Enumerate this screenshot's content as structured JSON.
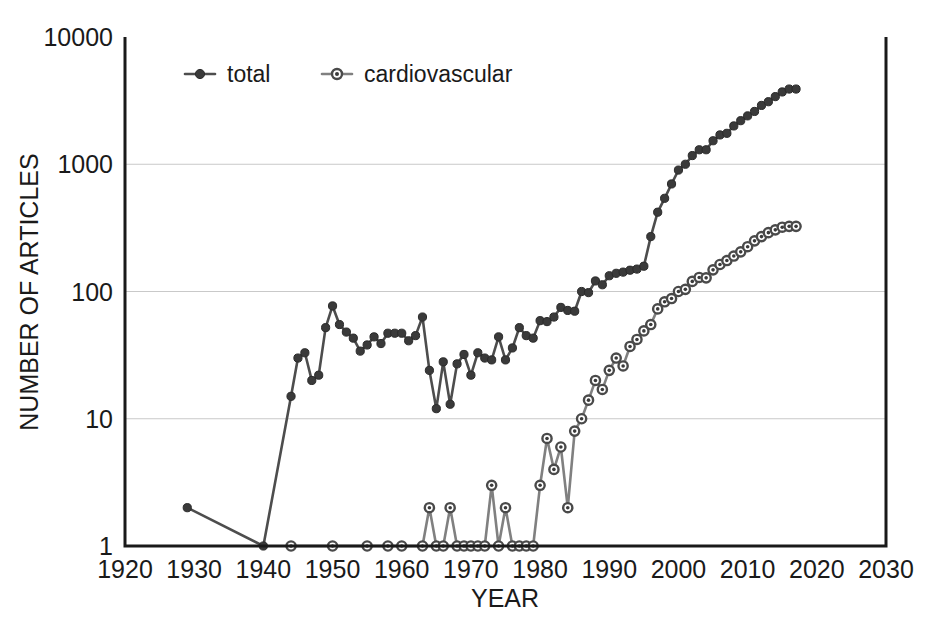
{
  "chart_data": {
    "type": "line",
    "title": "",
    "xlabel": "YEAR",
    "ylabel": "NUMBER OF ARTICLES",
    "xlim": [
      1920,
      2030
    ],
    "ylim": [
      1,
      10000
    ],
    "yscale": "log",
    "grid": "horizontal",
    "legend_position": "top-left-inside",
    "xticks": [
      1920,
      1930,
      1940,
      1950,
      1960,
      1970,
      1980,
      1990,
      2000,
      2010,
      2020,
      2030
    ],
    "xtick_labels": [
      "1920",
      "1930",
      "1940",
      "1950",
      "1960",
      "1970",
      "1980",
      "1990",
      "2000",
      "2010",
      "2020",
      "2030"
    ],
    "yticks": [
      1,
      10,
      100,
      1000,
      10000
    ],
    "ytick_labels": [
      "1",
      "10",
      "100",
      "1000",
      "10000"
    ],
    "series": [
      {
        "name": "total",
        "marker": "filled-circle",
        "color": "#3a3a3a",
        "x": [
          1929,
          1940,
          1944,
          1945,
          1946,
          1947,
          1948,
          1949,
          1950,
          1951,
          1952,
          1953,
          1954,
          1955,
          1956,
          1957,
          1958,
          1959,
          1960,
          1961,
          1962,
          1963,
          1964,
          1965,
          1966,
          1967,
          1968,
          1969,
          1970,
          1971,
          1972,
          1973,
          1974,
          1975,
          1976,
          1977,
          1978,
          1979,
          1980,
          1981,
          1982,
          1983,
          1984,
          1985,
          1986,
          1987,
          1988,
          1989,
          1990,
          1991,
          1992,
          1993,
          1994,
          1995,
          1996,
          1997,
          1998,
          1999,
          2000,
          2001,
          2002,
          2003,
          2004,
          2005,
          2006,
          2007,
          2008,
          2009,
          2010,
          2011,
          2012,
          2013,
          2014,
          2015,
          2016,
          2017
        ],
        "y": [
          2,
          1,
          15,
          30,
          33,
          20,
          22,
          52,
          77,
          55,
          48,
          43,
          34,
          38,
          44,
          39,
          47,
          47,
          47,
          41,
          45,
          63,
          24,
          12,
          28,
          13,
          27,
          32,
          22,
          33,
          30,
          29,
          44,
          29,
          36,
          52,
          45,
          43,
          59,
          58,
          63,
          75,
          71,
          70,
          100,
          98,
          121,
          113,
          133,
          139,
          142,
          147,
          150,
          158,
          270,
          420,
          540,
          700,
          900,
          1000,
          1170,
          1300,
          1300,
          1530,
          1700,
          1750,
          2000,
          2200,
          2400,
          2600,
          2900,
          3100,
          3400,
          3700,
          3900,
          3900
        ]
      },
      {
        "name": "cardiovascular",
        "marker": "bullseye-circle",
        "color": "#4a4a4a",
        "x": [
          1944,
          1950,
          1955,
          1958,
          1960,
          1963,
          1964,
          1965,
          1966,
          1967,
          1968,
          1969,
          1970,
          1971,
          1972,
          1973,
          1974,
          1975,
          1976,
          1977,
          1978,
          1979,
          1980,
          1981,
          1982,
          1983,
          1984,
          1985,
          1986,
          1987,
          1988,
          1989,
          1990,
          1991,
          1992,
          1993,
          1994,
          1995,
          1996,
          1997,
          1998,
          1999,
          2000,
          2001,
          2002,
          2003,
          2004,
          2005,
          2006,
          2007,
          2008,
          2009,
          2010,
          2011,
          2012,
          2013,
          2014,
          2015,
          2016,
          2017
        ],
        "y": [
          1,
          1,
          1,
          1,
          1,
          1,
          2,
          1,
          1,
          2,
          1,
          1,
          1,
          1,
          1,
          3,
          1,
          2,
          1,
          1,
          1,
          1,
          3,
          7,
          4,
          6,
          2,
          8,
          10,
          14,
          20,
          17,
          24,
          30,
          26,
          37,
          42,
          49,
          55,
          73,
          83,
          88,
          100,
          104,
          120,
          129,
          128,
          148,
          163,
          175,
          190,
          205,
          225,
          250,
          270,
          290,
          305,
          320,
          325,
          325
        ]
      }
    ]
  },
  "legend": {
    "entries": [
      {
        "label": "total"
      },
      {
        "label": "cardiovascular"
      }
    ]
  },
  "axes": {
    "x_title": "YEAR",
    "y_title": "NUMBER OF ARTICLES"
  }
}
